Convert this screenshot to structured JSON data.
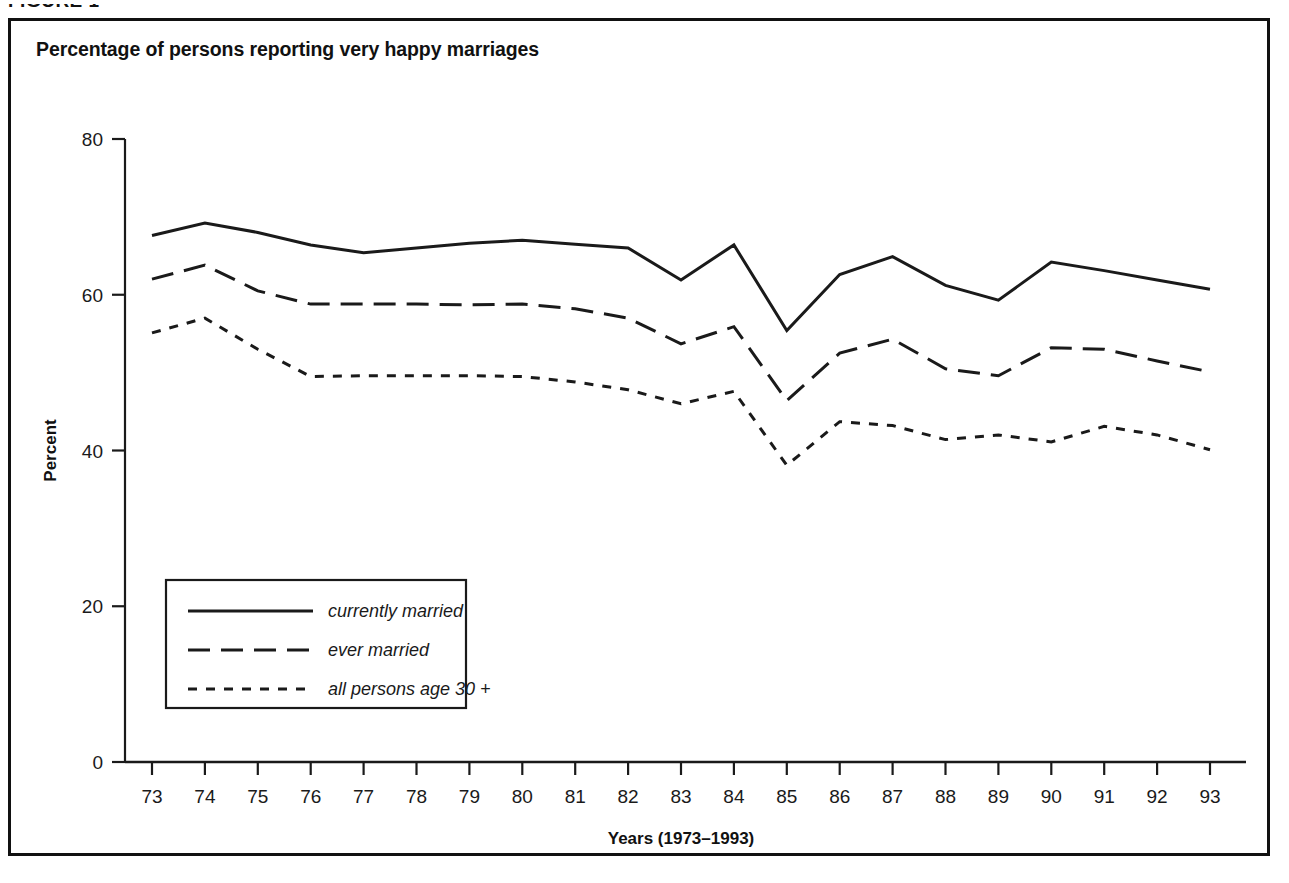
{
  "figure": {
    "label": "FIGURE 1"
  },
  "chart_title": "Percentage of persons reporting very happy marriages",
  "axes": {
    "ylabel": "Percent",
    "xlabel": "Years (1973–1993)",
    "y_ticks": [
      "0",
      "20",
      "40",
      "60",
      "80"
    ],
    "x_ticks": [
      "73",
      "74",
      "75",
      "76",
      "77",
      "78",
      "79",
      "80",
      "81",
      "82",
      "83",
      "84",
      "85",
      "86",
      "87",
      "88",
      "89",
      "90",
      "91",
      "92",
      "93"
    ]
  },
  "legend": {
    "items": [
      {
        "label": "currently married",
        "style": "solid"
      },
      {
        "label": "ever married",
        "style": "long-dash"
      },
      {
        "label": "all persons age 30 +",
        "style": "short-dash"
      }
    ]
  },
  "colors": {
    "line": "#1a1a1a",
    "frame": "#111111",
    "background": "#ffffff"
  },
  "chart_data": {
    "type": "line",
    "title": "Percentage of persons reporting very happy marriages",
    "xlabel": "Years (1973–1993)",
    "ylabel": "Percent",
    "xlim": [
      1973,
      1993
    ],
    "ylim": [
      0,
      80
    ],
    "ytick_values": [
      0,
      20,
      40,
      60,
      80
    ],
    "grid": false,
    "legend_position": "lower-left-inside",
    "x": [
      1973,
      1974,
      1975,
      1976,
      1977,
      1978,
      1979,
      1980,
      1981,
      1982,
      1983,
      1984,
      1985,
      1986,
      1987,
      1988,
      1989,
      1990,
      1991,
      1992,
      1993
    ],
    "xtick_labels": [
      "73",
      "74",
      "75",
      "76",
      "77",
      "78",
      "79",
      "80",
      "81",
      "82",
      "83",
      "84",
      "85",
      "86",
      "87",
      "88",
      "89",
      "90",
      "91",
      "92",
      "93"
    ],
    "series": [
      {
        "name": "currently married",
        "style": "solid",
        "values": [
          67.6,
          69.2,
          68.0,
          66.4,
          65.4,
          66.0,
          66.6,
          67.0,
          66.5,
          66.0,
          61.9,
          66.4,
          55.4,
          62.6,
          64.9,
          61.2,
          59.3,
          64.2,
          63.1,
          61.9,
          60.7
        ]
      },
      {
        "name": "ever married",
        "style": "long-dash",
        "values": [
          62.0,
          63.8,
          60.5,
          58.8,
          58.8,
          58.8,
          58.7,
          58.8,
          58.2,
          57.0,
          53.7,
          55.9,
          46.4,
          52.5,
          54.3,
          50.5,
          49.6,
          53.2,
          53.0,
          51.5,
          50.1
        ]
      },
      {
        "name": "all persons age 30 +",
        "style": "short-dash",
        "values": [
          55.1,
          57.0,
          53.0,
          49.5,
          49.6,
          49.6,
          49.6,
          49.5,
          48.8,
          47.8,
          46.0,
          47.6,
          38.1,
          43.7,
          43.2,
          41.4,
          42.0,
          41.1,
          43.1,
          42.0,
          40.1
        ]
      }
    ]
  }
}
